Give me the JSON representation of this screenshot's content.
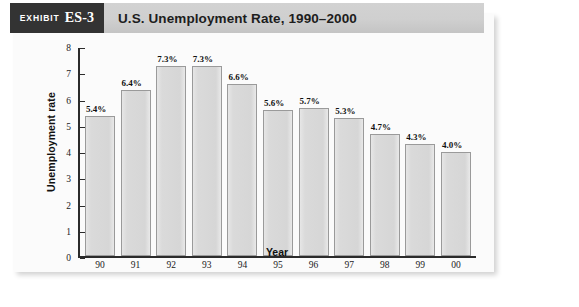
{
  "exhibit": {
    "badge_word": "Exhibit",
    "badge_number": "ES-3",
    "title": "U.S. Unemployment Rate, 1990–2000"
  },
  "colors": {
    "badge_bg": "#333333",
    "header_bg": "#cfcfcf",
    "bar_fill": "#d8d8d8",
    "bar_stroke": "#9a9a9a",
    "axis": "#2b2b2b",
    "panel_bg": "#fbfbfb"
  },
  "chart_data": {
    "type": "bar",
    "title": "U.S. Unemployment Rate, 1990–2000",
    "xlabel": "Year",
    "ylabel": "Unemployment rate",
    "categories": [
      "90",
      "91",
      "92",
      "93",
      "94",
      "95",
      "96",
      "97",
      "98",
      "99",
      "00"
    ],
    "values": [
      5.4,
      6.4,
      7.3,
      7.3,
      6.6,
      5.6,
      5.7,
      5.3,
      4.7,
      4.3,
      4.0
    ],
    "data_labels": [
      "5.4%",
      "6.4%",
      "7.3%",
      "7.3%",
      "6.6%",
      "5.6%",
      "5.7%",
      "5.3%",
      "4.7%",
      "4.3%",
      "4.0%"
    ],
    "ylim": [
      0,
      8
    ],
    "yticks": [
      0,
      1,
      2,
      3,
      4,
      5,
      6,
      7,
      8
    ],
    "ytick_labels": [
      "0",
      "1",
      "2",
      "3",
      "4",
      "5",
      "6",
      "7",
      "8"
    ],
    "grid": false,
    "legend": null
  }
}
